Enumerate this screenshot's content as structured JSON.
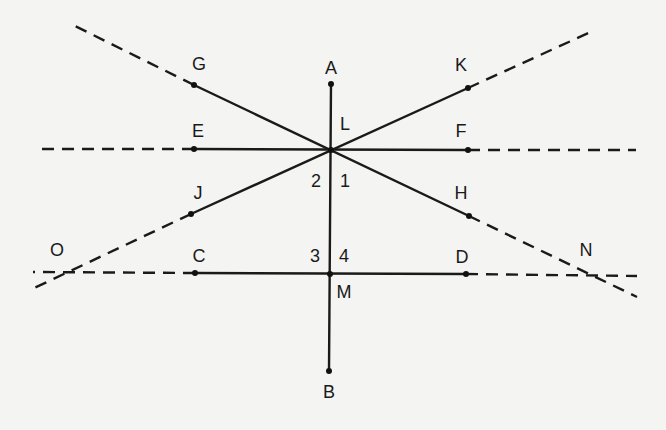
{
  "diagram": {
    "type": "geometry-lines-through-points",
    "colors": {
      "background": "#f4f4f2",
      "ink": "#1a1a1a"
    },
    "points": {
      "A": {
        "label": "A",
        "x": 331,
        "y": 84,
        "lx": 331,
        "ly": 68
      },
      "B": {
        "label": "B",
        "x": 329,
        "y": 371,
        "lx": 329,
        "ly": 392
      },
      "C": {
        "label": "C",
        "x": 195,
        "y": 273,
        "lx": 199,
        "ly": 256
      },
      "D": {
        "label": "D",
        "x": 466,
        "y": 274,
        "lx": 462,
        "ly": 257
      },
      "E": {
        "label": "E",
        "x": 194,
        "y": 149,
        "lx": 198,
        "ly": 131
      },
      "F": {
        "label": "F",
        "x": 468,
        "y": 150,
        "lx": 461,
        "ly": 131
      },
      "G": {
        "label": "G",
        "x": 194,
        "y": 85,
        "lx": 199,
        "ly": 64
      },
      "H": {
        "label": "H",
        "x": 469,
        "y": 216,
        "lx": 461,
        "ly": 193
      },
      "J": {
        "label": "J",
        "x": 191,
        "y": 214,
        "lx": 198,
        "ly": 193
      },
      "K": {
        "label": "K",
        "x": 468,
        "y": 88,
        "lx": 461,
        "ly": 65
      },
      "L": {
        "label": "L",
        "x": 331,
        "y": 150,
        "lx": 345,
        "ly": 124
      },
      "M": {
        "label": "M",
        "x": 330,
        "y": 274,
        "lx": 344,
        "ly": 292
      },
      "O": {
        "label": "O",
        "lx": 57,
        "ly": 250
      },
      "N": {
        "label": "N",
        "lx": 586,
        "ly": 250
      }
    },
    "angle_labels": {
      "a1": {
        "label": "1",
        "lx": 345,
        "ly": 181
      },
      "a2": {
        "label": "2",
        "lx": 316,
        "ly": 181
      },
      "a3": {
        "label": "3",
        "lx": 315,
        "ly": 256
      },
      "a4": {
        "label": "4",
        "lx": 344,
        "ly": 256
      }
    },
    "segments": [
      {
        "name": "AB",
        "from": "A",
        "to": "B",
        "style": "solid"
      },
      {
        "name": "EF",
        "from": "E",
        "to": "F",
        "style": "solid"
      },
      {
        "name": "CD",
        "from": "C",
        "to": "D",
        "style": "solid"
      },
      {
        "name": "GH",
        "from": "G",
        "to": "H",
        "style": "solid"
      },
      {
        "name": "JK",
        "from": "J",
        "to": "K",
        "style": "solid"
      }
    ],
    "extensions": [
      {
        "name": "ray-E-left",
        "x1": 194,
        "y1": 149,
        "x2": 37,
        "y2": 149
      },
      {
        "name": "ray-F-right",
        "x1": 468,
        "y1": 150,
        "x2": 636,
        "y2": 150
      },
      {
        "name": "ray-C-left",
        "x1": 195,
        "y1": 273,
        "x2": 33,
        "y2": 272
      },
      {
        "name": "ray-D-right",
        "x1": 466,
        "y1": 274,
        "x2": 637,
        "y2": 276
      },
      {
        "name": "ray-G-upleft",
        "x1": 194,
        "y1": 85,
        "x2": 73,
        "y2": 25
      },
      {
        "name": "ray-K-upright",
        "x1": 468,
        "y1": 88,
        "x2": 595,
        "y2": 30
      },
      {
        "name": "ray-J-downleft",
        "x1": 191,
        "y1": 214,
        "x2": 30,
        "y2": 290
      },
      {
        "name": "ray-H-downright",
        "x1": 469,
        "y1": 216,
        "x2": 637,
        "y2": 297
      }
    ]
  }
}
